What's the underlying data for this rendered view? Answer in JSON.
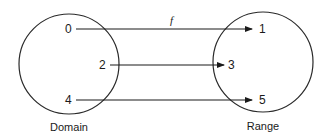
{
  "diagram": {
    "function_label": "f",
    "domain": {
      "caption": "Domain",
      "elements": [
        "0",
        "2",
        "4"
      ]
    },
    "range": {
      "caption": "Range",
      "elements": [
        "1",
        "3",
        "5"
      ]
    },
    "mappings": [
      {
        "from": "0",
        "to": "1"
      },
      {
        "from": "2",
        "to": "3"
      },
      {
        "from": "4",
        "to": "5"
      }
    ],
    "colors": {
      "stroke": "#2a2a2a",
      "text": "#1a1a1a",
      "background": "#ffffff"
    }
  }
}
